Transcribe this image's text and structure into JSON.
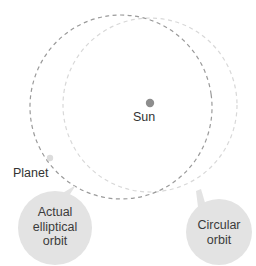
{
  "diagram": {
    "background_color": "#ffffff"
  },
  "sun": {
    "label": "Sun",
    "dot_color": "#8d8d8d",
    "cx": 150,
    "cy": 103,
    "r": 4.2
  },
  "planet": {
    "label": "Planet",
    "dot_color": "#dcdcdc",
    "cx": 50,
    "cy": 158,
    "r": 3.2
  },
  "orbits": {
    "elliptical": {
      "name": "actual-elliptical-orbit",
      "stroke_color": "#9a9a9a",
      "dash": "4 3.5",
      "cx": 121,
      "cy": 107,
      "rx": 91,
      "ry": 92,
      "rotation": -8
    },
    "circular": {
      "name": "circular-orbit",
      "stroke_color": "#d8d8d8",
      "dash": "4 3.5",
      "cx": 150,
      "cy": 105,
      "r": 87
    }
  },
  "callouts": [
    {
      "id": "elliptical",
      "label": "Actual\nelliptical\norbit",
      "line1": "Actual",
      "line2": "elliptical",
      "line3": "orbit",
      "badge_color": "#e3e3e3",
      "cx": 55,
      "cy": 228,
      "r": 37,
      "pointer_tip_x": 76,
      "pointer_tip_y": 186
    },
    {
      "id": "circular",
      "label": "Circular\norbit",
      "line1": "Circular",
      "line2": "orbit",
      "badge_color": "#e3e3e3",
      "cx": 219,
      "cy": 232,
      "r": 33,
      "pointer_tip_x": 201,
      "pointer_tip_y": 190
    }
  ]
}
